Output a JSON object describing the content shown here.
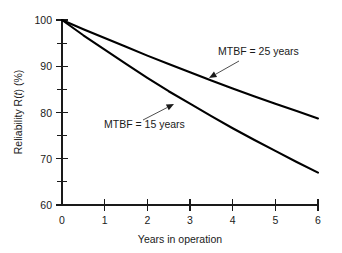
{
  "chart_data": {
    "type": "line",
    "title": "",
    "subtitle": "",
    "xlabel": "Years in operation",
    "ylabel": "Reliability R(t) (%)",
    "ylabel_parts": {
      "prefix": "Reliability R(",
      "italic": "t",
      "suffix": ") (%)"
    },
    "xlim": [
      0,
      6
    ],
    "ylim": [
      60,
      100
    ],
    "grid": false,
    "legend_position": "none",
    "x_ticks": [
      0,
      1,
      2,
      3,
      4,
      5,
      6
    ],
    "x_tick_labels": [
      "0",
      "1",
      "2",
      "3",
      "4",
      "5",
      "6"
    ],
    "y_ticks": [
      60,
      70,
      80,
      90,
      100
    ],
    "y_tick_labels": [
      "60",
      "70",
      "80",
      "90",
      "100"
    ],
    "y_minor_ticks": [
      65,
      75,
      85,
      95
    ],
    "x": [
      0,
      0.5,
      1,
      1.5,
      2,
      2.5,
      3,
      3.5,
      4,
      4.5,
      5,
      5.5,
      6
    ],
    "series": [
      {
        "name": "MTBF = 25 years",
        "mtbf_years": 25,
        "values": [
          100.0,
          98.0,
          96.1,
          94.2,
          92.3,
          90.5,
          88.7,
          86.9,
          85.2,
          83.5,
          81.9,
          80.3,
          78.7
        ]
      },
      {
        "name": "MTBF = 15 years",
        "mtbf_years": 15,
        "values": [
          100.0,
          96.7,
          93.6,
          90.5,
          87.5,
          84.6,
          81.9,
          79.2,
          76.6,
          74.1,
          71.7,
          69.3,
          67.0
        ]
      }
    ],
    "annotations": [
      {
        "text": "MTBF = 25 years",
        "text_x": 218,
        "text_y": 55,
        "leader_from_x": 239,
        "leader_from_y": 61,
        "leader_to_x": 209,
        "leader_to_y": 78,
        "target_series": "MTBF = 25 years"
      },
      {
        "text": "MTBF = 15 years",
        "text_x": 104,
        "text_y": 128,
        "leader_from_x": 143,
        "leader_from_y": 120,
        "leader_to_x": 174,
        "leader_to_y": 104,
        "target_series": "MTBF = 15 years"
      }
    ],
    "colors": {
      "curve": "#000000",
      "axis": "#1a1a1a",
      "text": "#1a1a1a",
      "background": "#ffffff"
    }
  }
}
